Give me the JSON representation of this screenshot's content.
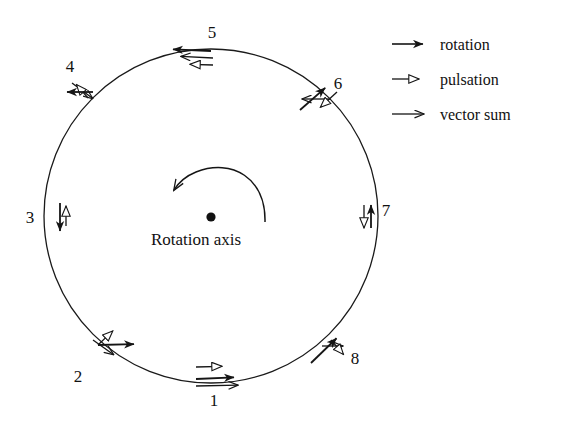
{
  "figure": {
    "center_label": "Rotation axis",
    "center_dot": {
      "cx": 211,
      "cy": 217,
      "r": 4.6
    },
    "circle": {
      "cx": 211,
      "cy": 216,
      "r": 167
    },
    "rotation_direction": "counterclockwise",
    "stroke_color": "#151515",
    "background_color": "#ffffff"
  },
  "legend": {
    "items": [
      {
        "label": "rotation",
        "arrowhead": "solid-filled",
        "icon": "arrow-right-solid-icon",
        "x1": 392,
        "y1": 44,
        "x2": 432,
        "y2": 44,
        "text_x": 440,
        "text_y": 50
      },
      {
        "label": "pulsation",
        "arrowhead": "hollow-open",
        "icon": "arrow-right-hollow-icon",
        "x1": 392,
        "y1": 79,
        "x2": 429,
        "y2": 79,
        "text_x": 440,
        "text_y": 85
      },
      {
        "label": "vector sum",
        "arrowhead": "thin-v",
        "icon": "arrow-right-thin-icon",
        "x1": 392,
        "y1": 114,
        "x2": 433,
        "y2": 114,
        "text_x": 440,
        "text_y": 120
      }
    ]
  },
  "points": [
    {
      "number": "1",
      "label_x": 214,
      "label_y": 406,
      "anchor_x": 211,
      "anchor_y": 383,
      "rotation": {
        "x1": 196,
        "y1": 379,
        "x2": 243,
        "y2": 377
      },
      "pulsation": {
        "x1": 196,
        "y1": 367,
        "x2": 232,
        "y2": 366
      },
      "vector_sum": {
        "x1": 196,
        "y1": 386,
        "x2": 247,
        "y2": 385
      }
    },
    {
      "number": "2",
      "label_x": 78,
      "label_y": 382,
      "anchor_x": 98,
      "anchor_y": 345,
      "rotation": {
        "x1": 98,
        "y1": 345,
        "x2": 143,
        "y2": 344
      },
      "pulsation": {
        "x1": 98,
        "y1": 345,
        "x2": 120,
        "y2": 324
      },
      "vector_sum": {
        "x1": 93,
        "y1": 340,
        "x2": 121,
        "y2": 360
      }
    },
    {
      "number": "3",
      "label_x": 30,
      "label_y": 223,
      "anchor_x": 46,
      "anchor_y": 216,
      "rotation": {
        "x1": 60,
        "y1": 203,
        "x2": 60,
        "y2": 240
      },
      "pulsation": {
        "x1": 66,
        "y1": 226,
        "x2": 66,
        "y2": 196
      },
      "vector_sum": null
    },
    {
      "number": "4",
      "label_x": 70,
      "label_y": 72,
      "anchor_x": 90,
      "anchor_y": 95,
      "rotation": {
        "x1": 93,
        "y1": 92,
        "x2": 58,
        "y2": 92
      },
      "pulsation": {
        "x1": 88,
        "y1": 98,
        "x2": 70,
        "y2": 77
      },
      "vector_sum": {
        "x1": 72,
        "y1": 83,
        "x2": 100,
        "y2": 104
      }
    },
    {
      "number": "5",
      "label_x": 212,
      "label_y": 38,
      "anchor_x": 211,
      "anchor_y": 49,
      "rotation": {
        "x1": 211,
        "y1": 51,
        "x2": 164,
        "y2": 49
      },
      "pulsation": {
        "x1": 213,
        "y1": 65,
        "x2": 180,
        "y2": 64
      },
      "vector_sum": {
        "x1": 213,
        "y1": 58,
        "x2": 172,
        "y2": 56
      }
    },
    {
      "number": "6",
      "label_x": 338,
      "label_y": 89,
      "anchor_x": 327,
      "anchor_y": 88,
      "rotation": {
        "x1": 300,
        "y1": 110,
        "x2": 332,
        "y2": 82
      },
      "pulsation": {
        "x1": 337,
        "y1": 92,
        "x2": 313,
        "y2": 114
      },
      "vector_sum": {
        "x1": 330,
        "y1": 99,
        "x2": 293,
        "y2": 99
      }
    },
    {
      "number": "7",
      "label_x": 386,
      "label_y": 216,
      "anchor_x": 378,
      "anchor_y": 216,
      "rotation": {
        "x1": 371,
        "y1": 228,
        "x2": 371,
        "y2": 196
      },
      "pulsation": {
        "x1": 364,
        "y1": 205,
        "x2": 364,
        "y2": 238
      },
      "vector_sum": null
    },
    {
      "number": "8",
      "label_x": 355,
      "label_y": 364,
      "anchor_x": 331,
      "anchor_y": 345,
      "rotation": {
        "x1": 311,
        "y1": 363,
        "x2": 343,
        "y2": 332
      },
      "pulsation": {
        "x1": 331,
        "y1": 340,
        "x2": 350,
        "y2": 362
      },
      "vector_sum": {
        "x1": 322,
        "y1": 346,
        "x2": 352,
        "y2": 346
      }
    }
  ],
  "rotation_arc": {
    "path": "M 265 222 C 266 178 232 158 196 172 C 186 176 179 182 174 190",
    "name": "counterclockwise-rotation-arc"
  }
}
